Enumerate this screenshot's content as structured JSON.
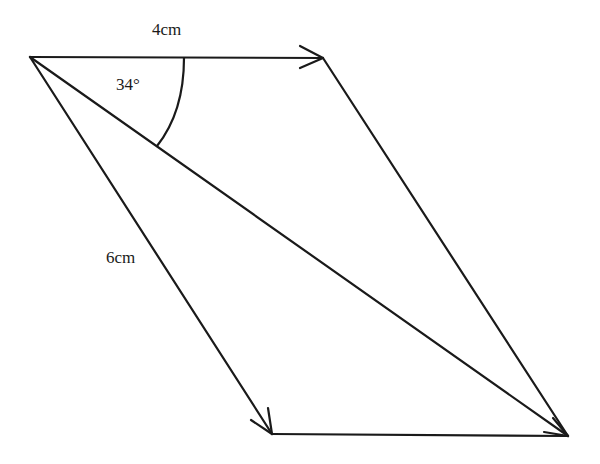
{
  "diagram": {
    "type": "vector parallelogram",
    "labels": {
      "top_side": "4cm",
      "left_side": "6cm",
      "angle": "34°"
    },
    "colors": {
      "stroke": "#1a1a1a",
      "background": "#ffffff"
    },
    "points": {
      "origin": [
        30,
        57
      ],
      "top_right": [
        323,
        58
      ],
      "bottom_left": [
        272,
        434
      ],
      "bottom_right": [
        568,
        436
      ]
    }
  }
}
